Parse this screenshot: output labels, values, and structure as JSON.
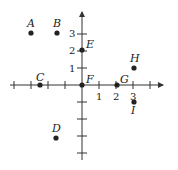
{
  "diagram": {
    "type": "coordinate-plane",
    "origin_px": [
      82,
      85
    ],
    "unit_px": 17,
    "colors": {
      "axis": "#333333",
      "point": "#222222",
      "text": "#222222"
    },
    "x_ticks": [
      {
        "value": 1,
        "label": "1"
      },
      {
        "value": 2,
        "label": "2"
      },
      {
        "value": 3,
        "label": "3"
      }
    ],
    "y_ticks": [
      {
        "value": 1,
        "label": "1"
      },
      {
        "value": 2,
        "label": "2"
      },
      {
        "value": 3,
        "label": "3"
      }
    ],
    "points": [
      {
        "name": "A",
        "x": -3,
        "y": 3
      },
      {
        "name": "B",
        "x": -1.5,
        "y": 3
      },
      {
        "name": "C",
        "x": -2.5,
        "y": 0
      },
      {
        "name": "D",
        "x": -1.5,
        "y": -3
      },
      {
        "name": "E",
        "x": 0,
        "y": 2
      },
      {
        "name": "F",
        "x": 0,
        "y": 0
      },
      {
        "name": "G",
        "x": 2,
        "y": 0
      },
      {
        "name": "H",
        "x": 3,
        "y": 1
      },
      {
        "name": "I",
        "x": 3,
        "y": -1
      }
    ]
  }
}
